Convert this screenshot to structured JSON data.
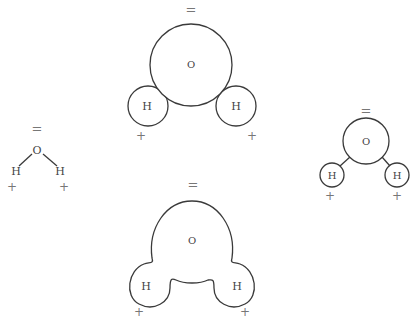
{
  "diagram": {
    "title": "",
    "models": [
      {
        "id": "ball-and-stick-small",
        "charge_O": "=",
        "atom_O": "O",
        "atom_H1": "H",
        "atom_H2": "H",
        "charge_H1": "+",
        "charge_H2": "+"
      },
      {
        "id": "space-filling",
        "charge_O": "=",
        "atom_O": "O",
        "atom_H1": "H",
        "atom_H2": "H",
        "charge_H1": "+",
        "charge_H2": "+"
      },
      {
        "id": "ball-and-stick",
        "charge_O": "=",
        "atom_O": "O",
        "atom_H1": "H",
        "atom_H2": "H",
        "charge_H1": "+",
        "charge_H2": "+"
      },
      {
        "id": "electron-cloud-outline",
        "charge_O": "=",
        "atom_O": "O",
        "atom_H1": "H",
        "atom_H2": "H",
        "charge_H1": "+",
        "charge_H2": "+"
      }
    ],
    "colors": {
      "stroke": "#3a3a3a",
      "text": "#444444",
      "symbol": "#777777"
    }
  }
}
